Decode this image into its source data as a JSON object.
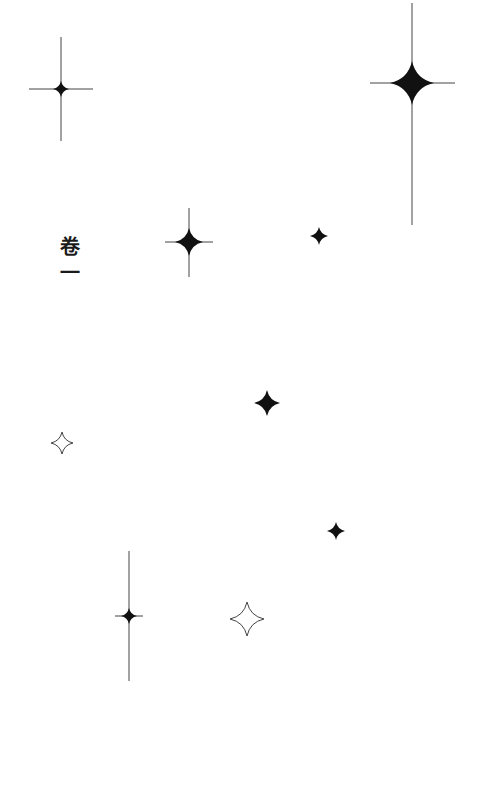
{
  "page": {
    "title": "卷一",
    "ink_color": "#111111",
    "line_color": "#444444"
  },
  "decorations": [
    {
      "name": "star-top-left",
      "style": "filled-with-rays"
    },
    {
      "name": "star-top-right-large",
      "style": "filled-with-rays"
    },
    {
      "name": "star-mid-left",
      "style": "filled-with-rays"
    },
    {
      "name": "star-small-1",
      "style": "filled"
    },
    {
      "name": "star-small-2",
      "style": "filled"
    },
    {
      "name": "star-outline-1",
      "style": "outline"
    },
    {
      "name": "star-small-3",
      "style": "filled"
    },
    {
      "name": "star-bottom-left",
      "style": "filled-with-rays"
    },
    {
      "name": "star-outline-2",
      "style": "outline"
    }
  ]
}
